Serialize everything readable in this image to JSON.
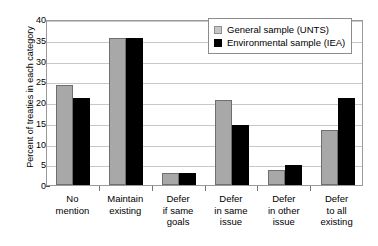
{
  "chart_data": {
    "type": "bar",
    "title": "",
    "xlabel": "",
    "ylabel": "Percent of treaties in each category",
    "ylim": [
      0,
      40
    ],
    "ytick_step": 5,
    "yticks": [
      40,
      35,
      30,
      25,
      20,
      15,
      10,
      5,
      0
    ],
    "grid": true,
    "legend_position": "top-right",
    "categories": [
      "No mention",
      "Maintain existing",
      "Defer if same goals",
      "Defer in same issue",
      "Defer in other issue",
      "Defer to all existing"
    ],
    "category_lines": [
      [
        "No",
        "mention"
      ],
      [
        "Maintain",
        "existing"
      ],
      [
        "Defer",
        "if same",
        "goals"
      ],
      [
        "Defer",
        "in same",
        "issue"
      ],
      [
        "Defer",
        "in other",
        "issue"
      ],
      [
        "Defer",
        "to all",
        "existing"
      ]
    ],
    "series": [
      {
        "name": "General sample (UNTS)",
        "color": "#a8a8a8",
        "values": [
          24.2,
          35.5,
          3.0,
          20.4,
          3.6,
          13.3
        ]
      },
      {
        "name": "Environmental sample (IEA)",
        "color": "#000000",
        "values": [
          20.9,
          35.4,
          3.0,
          14.5,
          4.8,
          21.0
        ]
      }
    ]
  },
  "legend": {
    "items": [
      {
        "label": "General sample (UNTS)",
        "swatch": "general"
      },
      {
        "label": "Environmental sample (IEA)",
        "swatch": "environmental"
      }
    ]
  }
}
